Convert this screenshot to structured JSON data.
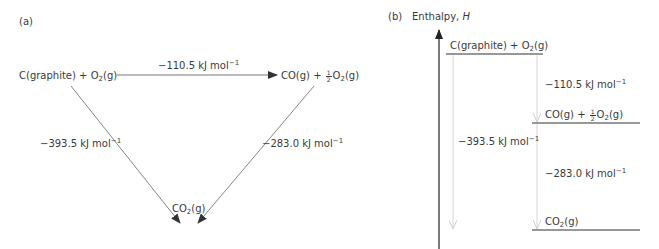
{
  "panel_a": {
    "label": "(a)",
    "nodes": {
      "reactants": {
        "prefix": "C(graphite) + O",
        "sub": "2",
        "suffix": "(g)"
      },
      "intermediate": {
        "prefix": "CO(g) + ",
        "frac_num": "1",
        "frac_den": "2",
        "mid": "O",
        "sub": "2",
        "suffix": "(g)"
      },
      "product": {
        "prefix": "CO",
        "sub": "2",
        "suffix": "(g)"
      }
    },
    "edges": [
      {
        "from": "reactants",
        "to": "intermediate",
        "value": "−110.5",
        "unit": " kJ mol",
        "exp": "−1"
      },
      {
        "from": "reactants",
        "to": "product",
        "value": "−393.5",
        "unit": " kJ mol",
        "exp": "−1"
      },
      {
        "from": "intermediate",
        "to": "product",
        "value": "−283.0",
        "unit": " kJ mol",
        "exp": "−1"
      }
    ]
  },
  "panel_b": {
    "label": "(b)",
    "axis_label": "Enthalpy, ",
    "axis_symbol": "H",
    "levels": [
      {
        "name": "reactants",
        "prefix": "C(graphite) + O",
        "sub": "2",
        "suffix": "(g)"
      },
      {
        "name": "intermediate",
        "prefix": "CO(g) + ",
        "frac_num": "1",
        "frac_den": "2",
        "mid": "O",
        "sub": "2",
        "suffix": "(g)"
      },
      {
        "name": "product",
        "prefix": "CO",
        "sub": "2",
        "suffix": "(g)"
      }
    ],
    "changes": [
      {
        "value": "−110.5",
        "unit": " kJ mol",
        "exp": "−1"
      },
      {
        "value": "−393.5",
        "unit": " kJ mol",
        "exp": "−1"
      },
      {
        "value": "−283.0",
        "unit": " kJ mol",
        "exp": "−1"
      }
    ]
  },
  "colors": {
    "text": "#3a3a3a",
    "line": "#555555",
    "level_line": "#333333",
    "faint_arrow": "#d0d0d0"
  }
}
